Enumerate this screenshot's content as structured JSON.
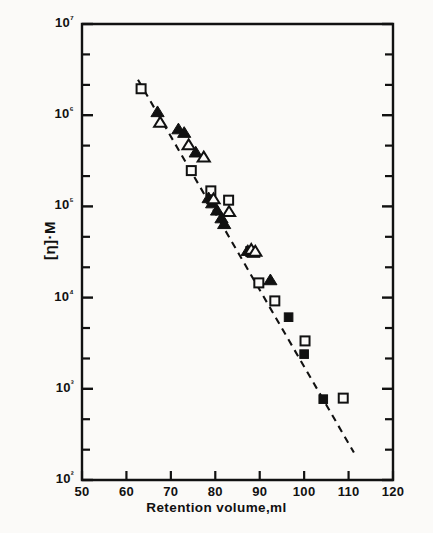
{
  "figure": {
    "background_color": "#fbfaf8",
    "ink_color": "#111111"
  },
  "axes": {
    "x_label": "Retention  volume,ml",
    "y_label": "[η]·M",
    "x_ticks": [
      "50",
      "60",
      "70",
      "80",
      "90",
      "100",
      "110",
      "120"
    ],
    "y_ticks": [
      "10²",
      "10³",
      "10⁴",
      "10⁵",
      "10⁶",
      "10⁷"
    ]
  },
  "chart_data": {
    "type": "scatter",
    "title": "",
    "xlabel": "Retention  volume,ml",
    "ylabel": "[η]·M",
    "xlim": [
      50,
      120
    ],
    "ylim": [
      100,
      10000000
    ],
    "yscale": "log",
    "xscale": "linear",
    "grid": false,
    "legend": "none",
    "x_major_ticks": [
      50,
      60,
      70,
      80,
      90,
      100,
      110,
      120
    ],
    "y_major_ticks": [
      100,
      1000,
      10000,
      100000,
      1000000,
      10000000
    ],
    "y_minor_ticks_per_decade": 2,
    "series": [
      {
        "name": "open-square",
        "marker": "open square",
        "points": [
          [
            63.3,
            1950000
          ],
          [
            74.6,
            247000
          ],
          [
            79.0,
            148000
          ],
          [
            83.0,
            117000
          ],
          [
            88.0,
            32000
          ],
          [
            89.8,
            14500
          ],
          [
            93.4,
            9200
          ],
          [
            100.2,
            3350
          ],
          [
            108.8,
            790
          ]
        ]
      },
      {
        "name": "filled-triangle",
        "marker": "filled triangle",
        "points": [
          [
            67.0,
            1080000
          ],
          [
            71.7,
            700000
          ],
          [
            73.0,
            640000
          ],
          [
            75.6,
            390000
          ],
          [
            78.5,
            123000
          ],
          [
            79.3,
            108000
          ],
          [
            80.4,
            90000
          ],
          [
            81.4,
            74000
          ],
          [
            82.0,
            64000
          ],
          [
            87.3,
            32500
          ],
          [
            88.6,
            31000
          ],
          [
            92.4,
            15500
          ]
        ]
      },
      {
        "name": "open-triangle",
        "marker": "open triangle",
        "points": [
          [
            67.6,
            830000
          ],
          [
            74.0,
            470000
          ],
          [
            77.4,
            345000
          ],
          [
            79.6,
            120000
          ],
          [
            83.1,
            87000
          ],
          [
            88.1,
            33500
          ],
          [
            89.0,
            32000
          ]
        ]
      },
      {
        "name": "filled-square",
        "marker": "filled square",
        "points": [
          [
            96.5,
            6100
          ],
          [
            100.0,
            2400
          ],
          [
            104.3,
            770
          ]
        ]
      }
    ],
    "fit_line": {
      "style": "dashed",
      "x_start": 62.6,
      "y_start": 2450000,
      "x_end": 111.2,
      "y_end": 200
    }
  }
}
